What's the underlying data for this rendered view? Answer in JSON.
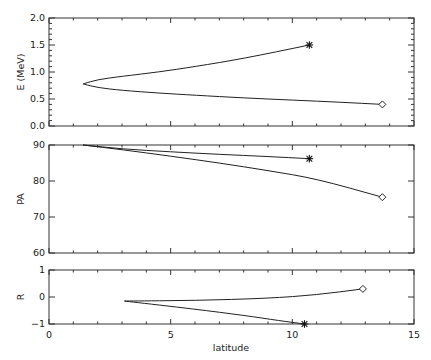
{
  "chart_data": [
    {
      "type": "line",
      "panel": "top",
      "ylabel": "E (MeV)",
      "xlabel": "",
      "xlim": [
        0,
        15
      ],
      "ylim": [
        0.0,
        2.0
      ],
      "yticks": [
        "0.0",
        "0.5",
        "1.0",
        "1.5",
        "2.0"
      ],
      "series": [
        {
          "name": "branch-asterisk",
          "x": [
            1.4,
            2.0,
            3.0,
            4.5,
            6.0,
            8.0,
            10.7
          ],
          "y": [
            0.78,
            0.86,
            0.92,
            1.0,
            1.1,
            1.25,
            1.5
          ],
          "end_marker": "asterisk"
        },
        {
          "name": "branch-diamond",
          "x": [
            1.4,
            2.0,
            3.0,
            4.5,
            6.0,
            8.0,
            10.0,
            12.0,
            13.7
          ],
          "y": [
            0.78,
            0.71,
            0.66,
            0.61,
            0.57,
            0.52,
            0.48,
            0.44,
            0.4
          ],
          "end_marker": "diamond"
        }
      ]
    },
    {
      "type": "line",
      "panel": "middle",
      "ylabel": "PA",
      "xlabel": "",
      "xlim": [
        0,
        15
      ],
      "ylim": [
        60,
        90
      ],
      "yticks": [
        "60",
        "70",
        "80",
        "90"
      ],
      "series": [
        {
          "name": "branch-asterisk",
          "x": [
            1.4,
            3.0,
            5.0,
            7.0,
            9.0,
            10.7
          ],
          "y": [
            90,
            88.9,
            88.1,
            87.4,
            86.8,
            86.2
          ],
          "end_marker": "asterisk"
        },
        {
          "name": "branch-diamond",
          "x": [
            1.4,
            3.0,
            5.0,
            7.0,
            9.0,
            11.0,
            13.7
          ],
          "y": [
            90,
            88.7,
            86.9,
            85.0,
            82.9,
            80.6,
            75.5
          ],
          "end_marker": "diamond"
        }
      ]
    },
    {
      "type": "line",
      "panel": "bottom",
      "ylabel": "R",
      "xlabel": "latitude",
      "xlim": [
        0,
        15
      ],
      "ylim": [
        -1,
        1
      ],
      "yticks": [
        "-1",
        "0",
        "1"
      ],
      "xticks": [
        "0",
        "5",
        "10",
        "15"
      ],
      "series": [
        {
          "name": "branch-diamond",
          "x": [
            3.1,
            6.0,
            9.0,
            11.0,
            12.9
          ],
          "y": [
            -0.15,
            -0.13,
            -0.05,
            0.08,
            0.3
          ],
          "end_marker": "diamond"
        },
        {
          "name": "branch-asterisk",
          "x": [
            3.1,
            6.0,
            8.0,
            9.5,
            10.5
          ],
          "y": [
            -0.15,
            -0.45,
            -0.68,
            -0.88,
            -1.0
          ],
          "end_marker": "asterisk"
        }
      ]
    }
  ],
  "labels": {
    "top_ylabel": "E (MeV)",
    "middle_ylabel": "PA",
    "bottom_ylabel": "R",
    "xlabel": "latitude",
    "top_yticks": [
      "0.0",
      "0.5",
      "1.0",
      "1.5",
      "2.0"
    ],
    "middle_yticks": [
      "60",
      "70",
      "80",
      "90"
    ],
    "bottom_yticks": [
      "-1",
      "0",
      "1"
    ],
    "xticks": [
      "0",
      "5",
      "10",
      "15"
    ]
  }
}
